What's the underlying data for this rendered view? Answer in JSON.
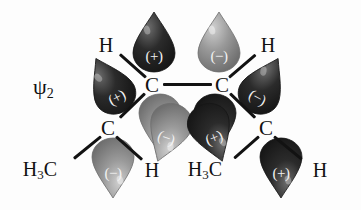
{
  "diagram": {
    "title_label": "ψ",
    "title_sub": "2",
    "type": "molecular-orbital-diagram",
    "molecule": "1,3-butadiene",
    "orbital": "psi-2",
    "colors": {
      "lobe_dark": "#2b2b2b",
      "lobe_light": "#9a9a9a",
      "bond": "#121212",
      "text": "#111111",
      "sign_text": "#f2f2f2",
      "background": "#fdfdfd"
    },
    "atoms": [
      {
        "name": "carbon-left-inner",
        "label": "C",
        "x": 152,
        "y": 85
      },
      {
        "name": "carbon-right-inner",
        "label": "C",
        "x": 222,
        "y": 85
      },
      {
        "name": "carbon-left-outer",
        "label": "C",
        "x": 108,
        "y": 128
      },
      {
        "name": "carbon-right-outer",
        "label": "C",
        "x": 266,
        "y": 128
      },
      {
        "name": "hydrogen-top-left",
        "label": "H",
        "x": 106,
        "y": 45
      },
      {
        "name": "hydrogen-top-right",
        "label": "H",
        "x": 268,
        "y": 45
      },
      {
        "name": "hydrogen-bottom-left",
        "label": "H",
        "x": 152,
        "y": 170
      },
      {
        "name": "hydrogen-bottom-right",
        "label": "H",
        "x": 320,
        "y": 170
      },
      {
        "name": "methyl-left",
        "label": "H",
        "sub": "3",
        "tail": "C",
        "x": 40,
        "y": 170
      },
      {
        "name": "methyl-right",
        "label": "H",
        "sub": "3",
        "tail": "C",
        "x": 205,
        "y": 170
      }
    ],
    "lobes": [
      {
        "name": "lobe-top-left-outer",
        "sign": "(+)",
        "shade": "dark",
        "cx": 110,
        "cy": 85,
        "rot": -28
      },
      {
        "name": "lobe-top-left-inner",
        "sign": "(+)",
        "shade": "dark",
        "cx": 154,
        "cy": 42,
        "rot": 0
      },
      {
        "name": "lobe-top-right-inner",
        "sign": "(−)",
        "shade": "light",
        "cx": 219,
        "cy": 42,
        "rot": 0
      },
      {
        "name": "lobe-top-right-outer",
        "sign": "(−)",
        "shade": "dark",
        "cx": 264,
        "cy": 85,
        "rot": 28
      },
      {
        "name": "lobe-bottom-left-inner",
        "sign": "(−)",
        "shade": "light",
        "cx": 160,
        "cy": 124,
        "rot": 180
      },
      {
        "name": "lobe-bottom-right-inner",
        "sign": "(+)",
        "shade": "dark",
        "cx": 215,
        "cy": 124,
        "rot": 180
      },
      {
        "name": "lobe-bottom-left-outer",
        "sign": "(−)",
        "shade": "light",
        "cx": 113,
        "cy": 168,
        "rot": 180
      },
      {
        "name": "lobe-bottom-right-outer",
        "sign": "(+)",
        "shade": "dark",
        "cx": 281,
        "cy": 168,
        "rot": 180
      },
      {
        "name": "lobe-left-lower-right",
        "sign": "(−)",
        "shade": "light",
        "cx": 168,
        "cy": 133,
        "rot": 200
      },
      {
        "name": "lobe-right-lower-left",
        "sign": "(+)",
        "shade": "dark",
        "cx": 212,
        "cy": 133,
        "rot": 160
      }
    ],
    "bonds": [
      {
        "name": "bond-c-c-central",
        "x1": 163,
        "y1": 84,
        "x2": 212,
        "y2": 84
      },
      {
        "name": "bond-c-left-to-h-top",
        "x1": 146,
        "y1": 77,
        "x2": 120,
        "y2": 54
      },
      {
        "name": "bond-c-left-to-c-outer",
        "x1": 145,
        "y1": 93,
        "x2": 120,
        "y2": 117
      },
      {
        "name": "bond-c-right-to-h-top",
        "x1": 229,
        "y1": 77,
        "x2": 256,
        "y2": 54
      },
      {
        "name": "bond-c-right-to-c-outer",
        "x1": 230,
        "y1": 93,
        "x2": 255,
        "y2": 117
      },
      {
        "name": "bond-c-outer-left-to-ch3",
        "x1": 101,
        "y1": 136,
        "x2": 74,
        "y2": 158
      },
      {
        "name": "bond-c-outer-left-to-h",
        "x1": 116,
        "y1": 136,
        "x2": 142,
        "y2": 159
      },
      {
        "name": "bond-c-outer-right-to-ch3",
        "x1": 259,
        "y1": 136,
        "x2": 234,
        "y2": 158
      },
      {
        "name": "bond-c-outer-right-to-h",
        "x1": 274,
        "y1": 136,
        "x2": 302,
        "y2": 159
      }
    ]
  }
}
